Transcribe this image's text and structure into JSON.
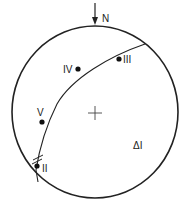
{
  "diagram": {
    "type": "stereonet",
    "north_label": "N",
    "center_label": "+",
    "annotation": "ΔI",
    "colors": {
      "stroke": "#222222",
      "background": "#ffffff"
    },
    "points": [
      {
        "id": "II",
        "label": "II"
      },
      {
        "id": "III",
        "label": "III"
      },
      {
        "id": "IV",
        "label": "IV"
      },
      {
        "id": "V",
        "label": "V"
      }
    ]
  }
}
